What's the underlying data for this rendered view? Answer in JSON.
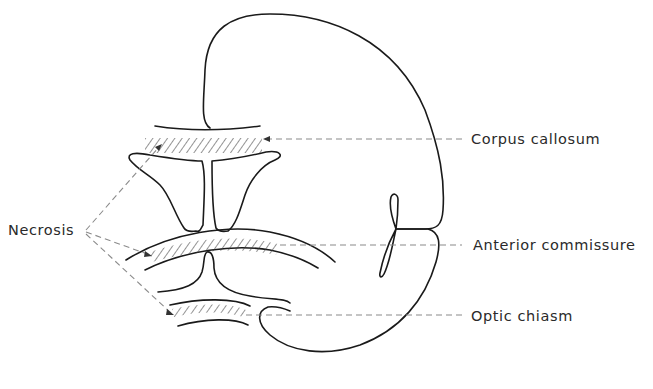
{
  "figure": {
    "type": "anatomical line diagram"
  },
  "labels": {
    "necrosis": "Necrosis",
    "corpus_callosum": "Corpus callosum",
    "anterior_commissure": "Anterior commissure",
    "optic_chiasm": "Optic chiasm"
  },
  "colors": {
    "outline": "#1a1a1a",
    "leader_lines": "#8a8a8a",
    "text": "#2a2a2a",
    "background": "#ffffff"
  }
}
